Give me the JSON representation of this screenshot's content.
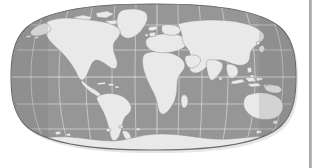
{
  "figure": {
    "kind": "world-map",
    "projection": "Eckert IV equal-area pseudocylindrical",
    "title": "",
    "ocean_color": "#969696",
    "land_color": "#e9e9e9",
    "land_stroke": "#8a8a8a",
    "graticule_color": "#e0e0e0",
    "outline_color": "#6b6b6b",
    "background_color": "#ffffff",
    "graticule_interval_deg": 30,
    "lon_range": [
      -180,
      180
    ],
    "lat_range": [
      -90,
      90
    ],
    "central_meridian": 0,
    "labels": {
      "meridians": [
        "-180",
        "-150",
        "-120",
        "-90",
        "-60",
        "-30",
        "0",
        "30",
        "60",
        "90",
        "120",
        "150",
        "180"
      ],
      "parallels": [
        "90",
        "60",
        "30",
        "0",
        "-30",
        "-60",
        "-90"
      ]
    },
    "landmasses": [
      "North America",
      "Greenland",
      "South America",
      "Africa",
      "Europe",
      "Asia",
      "Australia",
      "Antarctica",
      "Indonesia",
      "New Zealand",
      "Madagascar",
      "Japan",
      "British Isles",
      "Iceland",
      "Philippines"
    ]
  },
  "scrollbar": {
    "label": "vertical-divider",
    "color": "#a8a8a8"
  }
}
